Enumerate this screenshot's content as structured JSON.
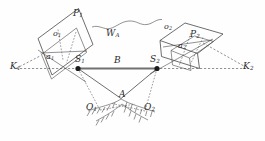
{
  "figure": {
    "type": "technical-line-diagram",
    "background_color": "#fefefe",
    "ink_color": "#3a3a3a",
    "baseline_color": "#6e6e6e",
    "width": 265,
    "height": 141
  },
  "labels": {
    "k1": {
      "base": "K",
      "sub": "1"
    },
    "k2": {
      "base": "K",
      "sub": "2"
    },
    "s1": {
      "base": "S",
      "sub": "1"
    },
    "s2": {
      "base": "S",
      "sub": "2"
    },
    "p1": {
      "base": "P",
      "sub": "1"
    },
    "p2": {
      "base": "P",
      "sub": "2"
    },
    "o1_small": {
      "base": "o",
      "sub": "1"
    },
    "o2_small": {
      "base": "o",
      "sub": "2"
    },
    "a1_small": {
      "base": "a",
      "sub": "1"
    },
    "a2_small": {
      "base": "a",
      "sub": "2"
    },
    "o1_cap": {
      "base": "O",
      "sub": "1"
    },
    "o2_cap": {
      "base": "O",
      "sub": "2"
    },
    "point_a": {
      "base": "A",
      "sub": ""
    },
    "baseline_b": {
      "base": "B",
      "sub": ""
    },
    "wa": {
      "base": "W",
      "sub": "A"
    }
  },
  "elements": {
    "left_image_plane": "parallelogram P1",
    "right_image_plane": "parallelogram P2",
    "left_inner_frame": "inner quadrilateral a1",
    "right_inner_frame": "inner quadrilateral a2",
    "baseline": "solid segment S1-S2 labelled B",
    "axis_line": "horizontal dashed line K1 to K2 through S1 and S2",
    "ray_left": "solid ray S1 to A",
    "ray_right": "solid ray S2 to A",
    "dashed_ray_left": "dashed ray S1 to O1",
    "dashed_ray_right": "dashed ray S2 to O2",
    "terrain": "hatched ground arcs near O1, A and O2",
    "wavy_connector": "irregular curve W_A joining the two image planes",
    "station_markers": [
      "S1",
      "S2"
    ]
  }
}
